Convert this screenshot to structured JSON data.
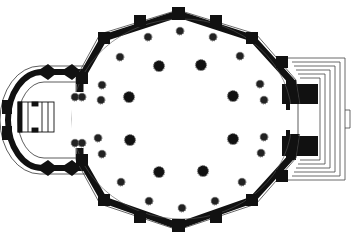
{
  "figure": {
    "type": "architectural-floor-plan",
    "colors": {
      "wall": "#111111",
      "background": "#ffffff",
      "line": "#333333",
      "column_ring": "#555555"
    }
  },
  "elements": {
    "octagon_wall": [
      [
        178,
        14
      ],
      [
        252,
        38
      ],
      [
        292,
        82
      ],
      [
        298,
        118
      ],
      [
        292,
        156
      ],
      [
        252,
        200
      ],
      [
        178,
        226
      ],
      [
        104,
        200
      ],
      [
        80,
        158
      ],
      [
        80,
        80
      ],
      [
        104,
        38
      ]
    ],
    "inner_columns": [
      [
        159,
        66
      ],
      [
        201,
        65
      ],
      [
        129,
        97
      ],
      [
        233,
        96
      ],
      [
        130,
        140
      ],
      [
        233,
        139
      ],
      [
        159,
        172
      ],
      [
        203,
        171
      ]
    ],
    "outer_columns": [
      [
        148,
        37
      ],
      [
        180,
        31
      ],
      [
        213,
        37
      ],
      [
        240,
        56
      ],
      [
        260,
        84
      ],
      [
        264,
        100
      ],
      [
        264,
        137
      ],
      [
        261,
        153
      ],
      [
        242,
        182
      ],
      [
        215,
        201
      ],
      [
        182,
        208
      ],
      [
        149,
        201
      ],
      [
        121,
        182
      ],
      [
        102,
        154
      ],
      [
        98,
        138
      ],
      [
        101,
        100
      ],
      [
        102,
        85
      ],
      [
        120,
        57
      ],
      [
        75,
        97
      ],
      [
        82,
        97
      ],
      [
        75,
        143
      ],
      [
        82,
        143
      ]
    ],
    "left_annex": {
      "center": [
        40,
        119
      ],
      "rx": 40,
      "ry": 58
    },
    "right_steps_count": 6
  }
}
